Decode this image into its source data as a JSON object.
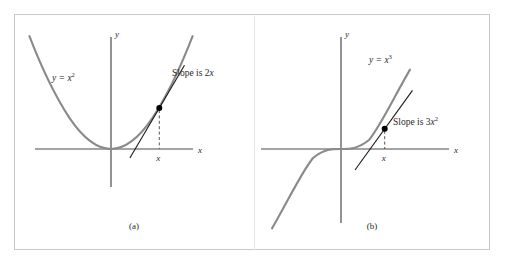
{
  "figure": {
    "background_color": "#ffffff",
    "frame_border_color": "#c9c9c9",
    "curve_color": "#8a8a8a",
    "axis_color": "#4a4a4a",
    "tangent_color": "#1a1a1a",
    "point_color": "#000000",
    "dash_color": "#555555",
    "text_color": "#2a2a2a"
  },
  "panels": [
    {
      "id": "a",
      "caption": "(a)",
      "axis_x_label": "x",
      "axis_y_label": "y",
      "curve_label": "y = x",
      "curve_label_exponent": "2",
      "slope_label": "Slope is 2x",
      "slope_label_exponent": "",
      "tick_label": "x"
    },
    {
      "id": "b",
      "caption": "(b)",
      "axis_x_label": "x",
      "axis_y_label": "y",
      "curve_label": "y = x",
      "curve_label_exponent": "3",
      "slope_label": "Slope is 3x",
      "slope_label_exponent": "2",
      "tick_label": "x"
    }
  ],
  "chart_data": [
    {
      "type": "line",
      "title": "(a)",
      "function": "y = x^2",
      "xlabel": "x",
      "ylabel": "y",
      "xlim": [
        -2.1,
        2.1
      ],
      "ylim": [
        -0.9,
        4.2
      ],
      "grid": false,
      "legend": "none",
      "series": [
        {
          "name": "y = x^2",
          "x": [
            -1.95,
            -1.75,
            -1.5,
            -1.25,
            -1.0,
            -0.75,
            -0.5,
            -0.25,
            0.0,
            0.25,
            0.5,
            0.75,
            1.0,
            1.25,
            1.5,
            1.75
          ],
          "y": [
            3.8,
            3.06,
            2.25,
            1.56,
            1.0,
            0.56,
            0.25,
            0.06,
            0.0,
            0.06,
            0.25,
            0.56,
            1.0,
            1.56,
            2.25,
            3.06
          ]
        },
        {
          "name": "tangent at x = 1.15",
          "x": [
            0.45,
            1.75
          ],
          "y": [
            -0.36,
            2.66
          ],
          "slope": 2.3
        }
      ],
      "annotations": [
        {
          "text": "y = x^2",
          "x": -1.35,
          "y": 2.0
        },
        {
          "text": "Slope is 2x",
          "x": 1.5,
          "y": 2.75
        },
        {
          "text": "x",
          "x": 1.15,
          "y": -0.32
        }
      ],
      "points": [
        {
          "x": 1.15,
          "y": 1.32,
          "label": "tangency point"
        }
      ],
      "dashed_drop_line": {
        "x": 1.15,
        "from_y": 1.32,
        "to_y": 0
      }
    },
    {
      "type": "line",
      "title": "(b)",
      "function": "y = x^3",
      "xlabel": "x",
      "ylabel": "y",
      "xlim": [
        -2.1,
        2.1
      ],
      "ylim": [
        -3.4,
        3.6
      ],
      "grid": false,
      "legend": "none",
      "series": [
        {
          "name": "y = x^3",
          "x": [
            -1.5,
            -1.25,
            -1.0,
            -0.75,
            -0.5,
            -0.25,
            0.0,
            0.25,
            0.5,
            0.75,
            1.0,
            1.25,
            1.45
          ],
          "y": [
            -3.38,
            -1.95,
            -1.0,
            -0.42,
            -0.13,
            -0.02,
            0.0,
            0.02,
            0.13,
            0.42,
            1.0,
            1.95,
            3.05
          ]
        },
        {
          "name": "tangent at x = 0.95",
          "x": [
            0.3,
            1.55
          ],
          "y": [
            -0.9,
            2.49
          ],
          "slope": 2.71
        }
      ],
      "annotations": [
        {
          "text": "y = x^3",
          "x": 0.55,
          "y": 2.6
        },
        {
          "text": "Slope is 3x^2",
          "x": 1.2,
          "y": 1.1
        },
        {
          "text": "x",
          "x": 0.95,
          "y": -0.42
        }
      ],
      "points": [
        {
          "x": 0.95,
          "y": 0.86,
          "label": "tangency point"
        }
      ],
      "dashed_drop_line": {
        "x": 0.95,
        "from_y": 0.86,
        "to_y": 0
      }
    }
  ]
}
